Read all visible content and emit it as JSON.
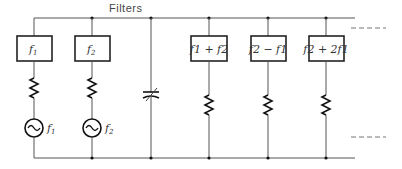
{
  "diagram": {
    "title": "Filters",
    "source_branches": [
      {
        "filter_label": "f",
        "filter_sub": "1",
        "source_label": "f",
        "source_sub": "1"
      },
      {
        "filter_label": "f",
        "filter_sub": "2",
        "source_label": "f",
        "source_sub": "2"
      }
    ],
    "capacitor": {
      "type": "variable-capacitor"
    },
    "output_branches": [
      {
        "filter_label": "f1 + f2"
      },
      {
        "filter_label": "f2 − f1"
      },
      {
        "filter_label": "f2 + 2f1"
      }
    ],
    "continuation": "– – – –"
  }
}
